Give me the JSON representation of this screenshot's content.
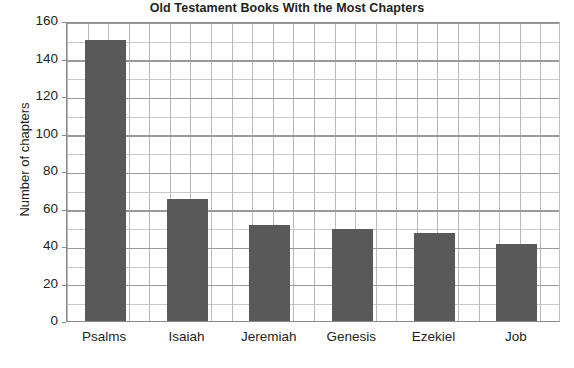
{
  "chart_data": {
    "type": "bar",
    "title": "Old Testament Books With the Most Chapters",
    "xlabel": "",
    "ylabel": "Number of chapters",
    "categories": [
      "Psalms",
      "Isaiah",
      "Jeremiah",
      "Genesis",
      "Ezekiel",
      "Job"
    ],
    "values": [
      150,
      65,
      51,
      49,
      47,
      41
    ],
    "ylim": [
      0,
      160
    ],
    "ytick_step": 20,
    "yticks": [
      0,
      20,
      40,
      60,
      80,
      100,
      120,
      140,
      160
    ],
    "ytick_labels": [
      "0",
      "20",
      "40",
      "60",
      "80",
      "100",
      "120",
      "140",
      "160"
    ],
    "minor_gridline_step": 10,
    "grid": true,
    "legend": false,
    "legend_position": "none",
    "bar_color": "#595959",
    "grid_color": "#c2c2c2",
    "axis_color": "#8a8a8a",
    "text_color": "#231f20",
    "background_color": "#ffffff"
  }
}
